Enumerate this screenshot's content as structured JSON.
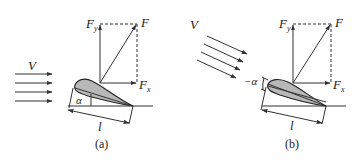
{
  "figure": {
    "panels": [
      {
        "id": "a",
        "caption": "(a)",
        "flow_label": "V",
        "force_label": "F",
        "fy_label": "F",
        "fy_sub": "y",
        "fx_label": "F",
        "fx_sub": "x",
        "angle_label": "α",
        "chord_label": "l",
        "flow_direction": "horizontal",
        "flow_arrow_count": 4
      },
      {
        "id": "b",
        "caption": "(b)",
        "flow_label": "V",
        "force_label": "F",
        "fy_label": "F",
        "fy_sub": "y",
        "fx_label": "F",
        "fx_sub": "x",
        "angle_label": "−α",
        "chord_label": "l",
        "flow_direction": "inclined-downward",
        "flow_arrow_count": 4
      }
    ],
    "colors": {
      "line": "#333333",
      "airfoil_fill": "#b8b8b8",
      "background": "#ffffff"
    }
  }
}
